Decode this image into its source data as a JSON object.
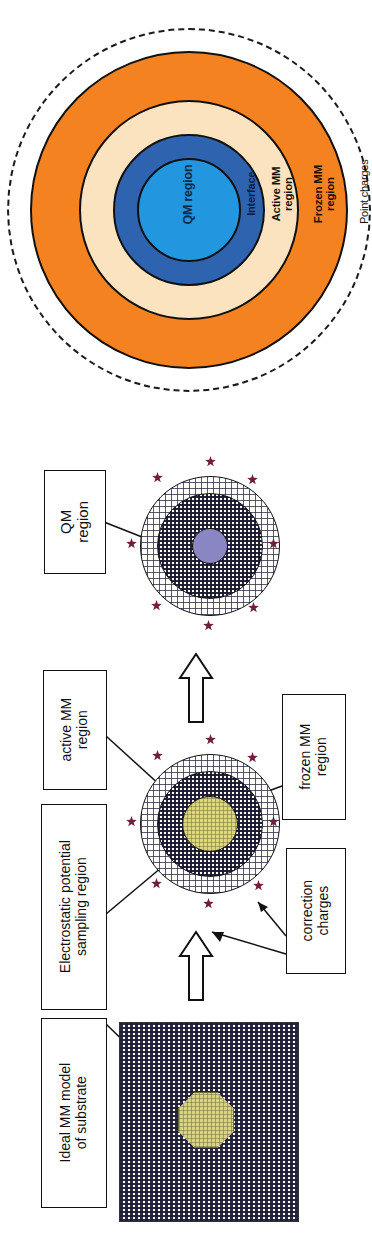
{
  "figure": {
    "orientation": "rotated-90",
    "panels": [
      "concentric-region-diagram",
      "workflow-diagram"
    ]
  },
  "panel_a": {
    "name": "concentric-region-diagram",
    "rings": [
      {
        "id": "qm",
        "label": "QM region",
        "color": "#2296DE",
        "style": "solid",
        "r": 52
      },
      {
        "id": "interface",
        "label": "Interface",
        "color": "#2E63B0",
        "style": "solid",
        "r": 76
      },
      {
        "id": "active_mm",
        "label": "Active MM\nregion",
        "color": "#FCE3C0",
        "style": "solid",
        "r": 110
      },
      {
        "id": "frozen_mm",
        "label": "Frozen MM\nregion",
        "color": "#F58220",
        "style": "solid",
        "r": 159
      },
      {
        "id": "point_charges",
        "label": "Point charges",
        "color": "none",
        "style": "dashed",
        "r": 182
      }
    ],
    "label_colors": {
      "qm": "#0d2b46",
      "interface": "#0d1a30",
      "active_mm": "#14100a",
      "frozen_mm": "#1a0d00",
      "point_charges": "#111111"
    }
  },
  "panel_b": {
    "name": "workflow-diagram",
    "boxes": [
      {
        "id": "qm-region-box",
        "text": "QM\nregion"
      },
      {
        "id": "active-mm-box",
        "text": "active MM\nregion"
      },
      {
        "id": "frozen-mm-box",
        "text": "frozen MM\nregion"
      },
      {
        "id": "esp-box",
        "text": "Electrostatic potential\nsampling region"
      },
      {
        "id": "correction-box",
        "text": "correction\ncharges"
      },
      {
        "id": "ideal-mm-box",
        "text": "Ideal MM model\nof substrate"
      }
    ],
    "clusters": [
      {
        "id": "cluster-qm",
        "center_color": "#8a86c4",
        "center_label": "QM region"
      },
      {
        "id": "cluster-mid",
        "center_color": "#d7d383",
        "center_label": "sampling region"
      }
    ],
    "substrate": {
      "id": "substrate-slab",
      "inclusion_color": "#d7d383"
    },
    "arrows": {
      "count": 2,
      "direction": "up"
    },
    "charge_marker": {
      "name": "correction-charge-star",
      "color": "#6d1f3c",
      "count_per_cluster": 8
    }
  },
  "palette": {
    "orange": "#F58220",
    "cream": "#FCE3C0",
    "dark_blue": "#2E63B0",
    "light_blue": "#2296DE",
    "outline": "#101010",
    "star": "#6d1f3c",
    "yellow": "#d7d383",
    "purple": "#8a86c4"
  }
}
